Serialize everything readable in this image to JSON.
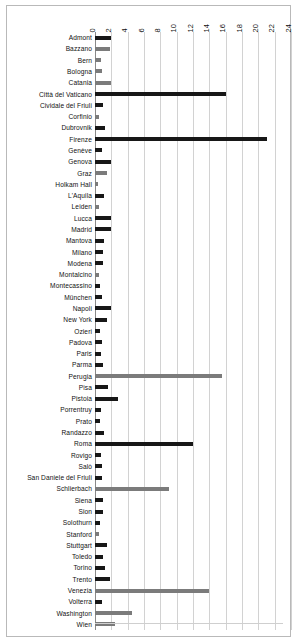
{
  "chart_data": {
    "type": "bar",
    "orientation": "horizontal",
    "title": "",
    "xlabel": "",
    "ylabel": "",
    "xlim": [
      0,
      24
    ],
    "xticks": [
      0,
      2,
      4,
      6,
      8,
      10,
      12,
      14,
      16,
      18,
      20,
      22,
      24
    ],
    "tick_labels": [
      "0",
      "2",
      "4",
      "6",
      "8",
      "10",
      "12",
      "14",
      "16",
      "18",
      "20",
      "22",
      "24"
    ],
    "grid": true,
    "legend": "none",
    "tick_label_rotation": 90,
    "colors": {
      "dark": "#171717",
      "gray": "#7b7b7b",
      "grid": "#d2d2d2",
      "axis": "#8a8a8a",
      "frame": "#b9b9b9"
    },
    "categories": [
      "Admont",
      "Bazzano",
      "Bern",
      "Bologna",
      "Catania",
      "Città del Vaticano",
      "Cividale del Friuli",
      "Corfinio",
      "Dubrovnik",
      "Firenze",
      "Genève",
      "Genova",
      "Graz",
      "Holkam Hall",
      "L'Aquila",
      "Leiden",
      "Lucca",
      "Madrid",
      "Mantova",
      "Milano",
      "Modena",
      "Montalcino",
      "Montecassino",
      "München",
      "Napoli",
      "New York",
      "Ozieri",
      "Padova",
      "Paris",
      "Parma",
      "Perugia",
      "Pisa",
      "Pistoia",
      "Porrentruy",
      "Prato",
      "Randazzo",
      "Roma",
      "Rovigo",
      "Salò",
      "San Daniele del Friuli",
      "Schlierbach",
      "Siena",
      "Sion",
      "Solothurn",
      "Stanford",
      "Stuttgart",
      "Toledo",
      "Torino",
      "Trento",
      "Venezia",
      "Volterra",
      "Washington",
      "Wien"
    ],
    "values": [
      2.0,
      1.8,
      0.7,
      0.8,
      1.9,
      16.0,
      1.0,
      0.5,
      1.2,
      21.0,
      0.9,
      2.0,
      1.5,
      0.4,
      1.1,
      0.5,
      1.9,
      2.0,
      1.1,
      1.0,
      1.0,
      0.5,
      0.6,
      0.9,
      2.0,
      1.5,
      0.6,
      0.8,
      0.7,
      1.0,
      15.6,
      1.6,
      2.8,
      0.7,
      0.6,
      1.1,
      12.0,
      0.7,
      0.8,
      0.9,
      9.0,
      1.0,
      1.0,
      0.6,
      0.5,
      1.5,
      1.0,
      1.2,
      1.8,
      14.0,
      0.8,
      4.5,
      2.5
    ],
    "bar_colors": [
      "dark",
      "gray",
      "gray",
      "gray",
      "gray",
      "dark",
      "dark",
      "gray",
      "dark",
      "dark",
      "dark",
      "dark",
      "gray",
      "gray",
      "dark",
      "gray",
      "dark",
      "dark",
      "dark",
      "dark",
      "dark",
      "gray",
      "dark",
      "dark",
      "dark",
      "dark",
      "dark",
      "dark",
      "dark",
      "dark",
      "gray",
      "dark",
      "dark",
      "dark",
      "dark",
      "dark",
      "dark",
      "dark",
      "dark",
      "dark",
      "gray",
      "dark",
      "dark",
      "dark",
      "gray",
      "dark",
      "dark",
      "dark",
      "dark",
      "gray",
      "dark",
      "gray",
      "gray"
    ]
  }
}
